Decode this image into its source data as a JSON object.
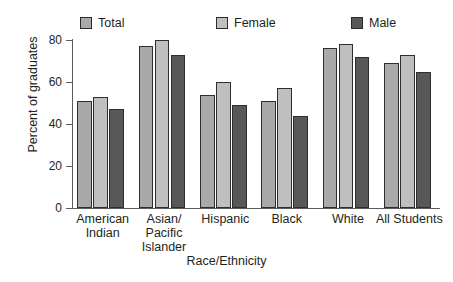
{
  "chart_data": {
    "type": "bar",
    "title": "",
    "xlabel": "Race/Ethnicity",
    "ylabel": "Percent of graduates",
    "categories": [
      "American Indian",
      "Asian/ Pacific Islander",
      "Hispanic",
      "Black",
      "White",
      "All Students"
    ],
    "category_lines": [
      [
        "American",
        "Indian"
      ],
      [
        "Asian/",
        "Pacific",
        "Islander"
      ],
      [
        "Hispanic"
      ],
      [
        "Black"
      ],
      [
        "White"
      ],
      [
        "All Students"
      ]
    ],
    "series": [
      {
        "name": "Total",
        "color": "#a9a9a9",
        "values": [
          51,
          77,
          54,
          51,
          76,
          69
        ]
      },
      {
        "name": "Female",
        "color": "#bfbfbf",
        "values": [
          53,
          80,
          60,
          57,
          78,
          73
        ]
      },
      {
        "name": "Male",
        "color": "#585858",
        "values": [
          47,
          73,
          49,
          44,
          72,
          65
        ]
      }
    ],
    "ylim": [
      0,
      80
    ],
    "yticks": [
      0,
      20,
      40,
      60,
      80
    ],
    "ytick_labels": [
      "0",
      "20",
      "40",
      "60",
      "80"
    ],
    "grid": false,
    "legend_position": "top"
  },
  "legend": {
    "items": [
      {
        "label": "Total",
        "color": "#a9a9a9"
      },
      {
        "label": "Female",
        "color": "#bfbfbf"
      },
      {
        "label": "Male",
        "color": "#585858"
      }
    ]
  }
}
